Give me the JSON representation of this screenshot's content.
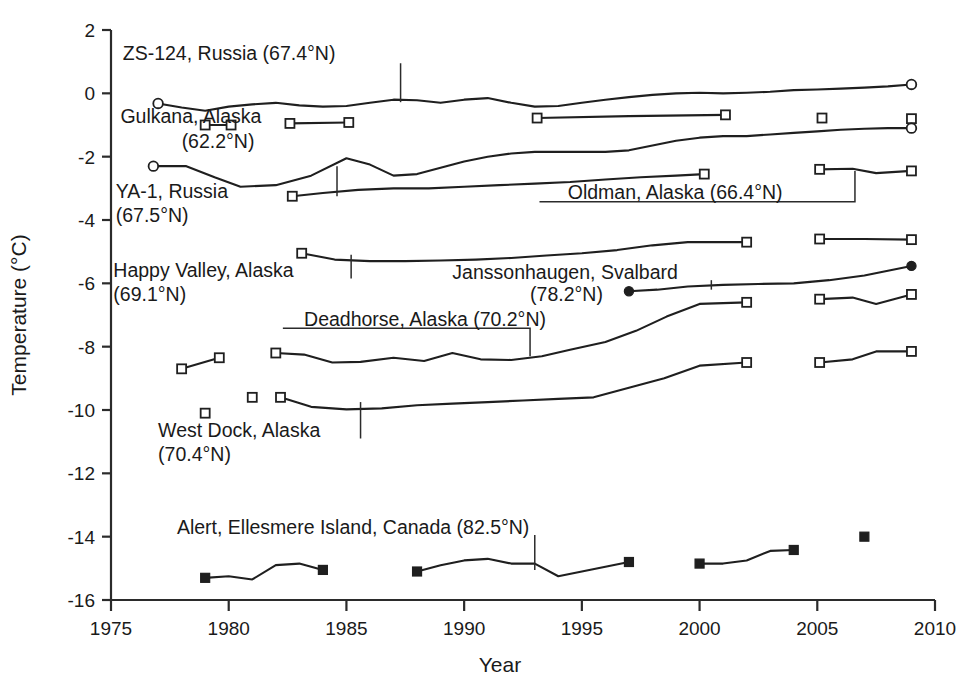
{
  "chart_data": {
    "type": "line",
    "title": "",
    "xlabel": "Year",
    "ylabel": "Temperature (°C)",
    "xlim": [
      1975,
      2010
    ],
    "ylim": [
      -16,
      2
    ],
    "xticks": [
      1975,
      1980,
      1985,
      1990,
      1995,
      2000,
      2005,
      2010
    ],
    "yticks": [
      2,
      0,
      -2,
      -4,
      -6,
      -8,
      -10,
      -12,
      -14,
      -16
    ],
    "grid": false,
    "legend_position": "inline-annotations",
    "series": [
      {
        "name": "ZS-124, Russia (67.4°N)",
        "label": "ZS-124, Russia (67.4°N)",
        "marker": "open-circle",
        "segments": [
          {
            "x": [
              1977,
              1978,
              1979,
              1980,
              1981,
              1982,
              1983,
              1984,
              1985,
              1986,
              1987,
              1988,
              1989,
              1990,
              1991,
              1992,
              1993,
              1994,
              1995,
              1996,
              1997,
              1998,
              1999,
              2000,
              2001,
              2002,
              2003,
              2004,
              2005,
              2006,
              2007,
              2008,
              2009
            ],
            "y": [
              -0.32,
              -0.45,
              -0.55,
              -0.42,
              -0.35,
              -0.3,
              -0.38,
              -0.42,
              -0.4,
              -0.3,
              -0.2,
              -0.22,
              -0.3,
              -0.2,
              -0.15,
              -0.3,
              -0.42,
              -0.4,
              -0.3,
              -0.2,
              -0.12,
              -0.05,
              0.0,
              0.02,
              0.0,
              0.02,
              0.05,
              0.1,
              0.12,
              0.15,
              0.18,
              0.22,
              0.28
            ],
            "start_marker": "open-circle",
            "end_marker": "open-circle"
          }
        ]
      },
      {
        "name": "Gulkana, Alaska (62.2°N)",
        "label": "Gulkana, Alaska (62.2°N)",
        "marker": "open-square",
        "segments": [
          {
            "x": [
              1979,
              1980.1
            ],
            "y": [
              -1.0,
              -1.0
            ],
            "start_marker": "open-square",
            "end_marker": "open-square"
          },
          {
            "x": [
              1982.6,
              1985.1
            ],
            "y": [
              -0.95,
              -0.92
            ],
            "start_marker": "open-square",
            "end_marker": "open-square"
          },
          {
            "x": [
              1993.1,
              1997.0,
              2001.1
            ],
            "y": [
              -0.78,
              -0.72,
              -0.68
            ],
            "start_marker": "open-square",
            "end_marker": "open-square"
          },
          {
            "x": [
              2005.2
            ],
            "y": [
              -0.78
            ],
            "start_marker": "open-square",
            "end_marker": "open-square"
          },
          {
            "x": [
              2009.0
            ],
            "y": [
              -0.8
            ],
            "start_marker": "open-square",
            "end_marker": "open-square"
          }
        ]
      },
      {
        "name": "YA-1, Russia (67.5°N)",
        "label": "YA-1, Russia (67.5°N)",
        "marker": "open-circle",
        "segments": [
          {
            "x": [
              1976.8,
              1978.2,
              1979.4,
              1980.5,
              1982,
              1983.5,
              1985,
              1986,
              1987,
              1988,
              1989,
              1990,
              1991,
              1992,
              1993,
              1994,
              1995,
              1996,
              1997,
              1998,
              1999,
              2000,
              2001,
              2002,
              2003,
              2004,
              2005,
              2006,
              2007,
              2008,
              2009
            ],
            "y": [
              -2.3,
              -2.3,
              -2.65,
              -2.95,
              -2.9,
              -2.6,
              -2.05,
              -2.25,
              -2.6,
              -2.55,
              -2.35,
              -2.15,
              -2.0,
              -1.9,
              -1.85,
              -1.85,
              -1.85,
              -1.85,
              -1.8,
              -1.65,
              -1.5,
              -1.4,
              -1.35,
              -1.35,
              -1.3,
              -1.25,
              -1.2,
              -1.15,
              -1.12,
              -1.1,
              -1.1
            ],
            "start_marker": "open-circle",
            "end_marker": "open-circle"
          }
        ]
      },
      {
        "name": "Oldman, Alaska (66.4°N)",
        "label": "Oldman, Alaska (66.4°N)",
        "marker": "open-square",
        "segments": [
          {
            "x": [
              1982.7,
              1984,
              1985.5,
              1987,
              1988.5,
              1990,
              1991.5,
              1993,
              1994.5,
              1996,
              1997.5,
              1999,
              2000.2
            ],
            "y": [
              -3.25,
              -3.15,
              -3.05,
              -3.0,
              -3.0,
              -2.95,
              -2.9,
              -2.85,
              -2.8,
              -2.72,
              -2.65,
              -2.6,
              -2.55
            ],
            "start_marker": "open-square",
            "end_marker": "open-square"
          },
          {
            "x": [
              2005.1,
              2006.5,
              2007.5,
              2009
            ],
            "y": [
              -2.4,
              -2.38,
              -2.52,
              -2.45
            ],
            "start_marker": "open-square",
            "end_marker": "open-square"
          }
        ]
      },
      {
        "name": "Happy Valley, Alaska (69.1°N)",
        "label": "Happy Valley, Alaska (69.1°N)",
        "marker": "open-square",
        "segments": [
          {
            "x": [
              1983.1,
              1984.5,
              1986,
              1987.5,
              1989,
              1990.5,
              1992,
              1993.5,
              1995,
              1996.5,
              1998,
              1999.5,
              2002
            ],
            "y": [
              -5.05,
              -5.25,
              -5.3,
              -5.3,
              -5.28,
              -5.25,
              -5.2,
              -5.12,
              -5.05,
              -4.95,
              -4.8,
              -4.7,
              -4.7
            ],
            "start_marker": "open-square",
            "end_marker": "open-square"
          },
          {
            "x": [
              2005.1,
              2007,
              2009
            ],
            "y": [
              -4.6,
              -4.6,
              -4.62
            ],
            "start_marker": "open-square",
            "end_marker": "open-square"
          }
        ]
      },
      {
        "name": "Janssonhaugen, Svalbard (78.2°N)",
        "label": "Janssonhaugen, Svalbard (78.2°N)",
        "marker": "filled-circle",
        "segments": [
          {
            "x": [
              1997.0,
              1998.2,
              1999.5,
              2001,
              2002.5,
              2004,
              2005.5,
              2007,
              2008,
              2009
            ],
            "y": [
              -6.25,
              -6.2,
              -6.1,
              -6.05,
              -6.02,
              -6.0,
              -5.9,
              -5.75,
              -5.6,
              -5.45
            ],
            "start_marker": "filled-circle",
            "end_marker": "filled-circle"
          }
        ]
      },
      {
        "name": "Deadhorse, Alaska (70.2°N)",
        "label": "Deadhorse, Alaska (70.2°N)",
        "marker": "open-square",
        "segments": [
          {
            "x": [
              1978,
              1979.6
            ],
            "y": [
              -8.7,
              -8.35
            ],
            "start_marker": "open-square",
            "end_marker": "open-square"
          },
          {
            "x": [
              1982,
              1983.2,
              1984.4,
              1985.6,
              1987,
              1988.3,
              1989.5,
              1990.7,
              1992,
              1993.3,
              1994.5,
              1996,
              1997.3,
              1998.6,
              2000,
              2002
            ],
            "y": [
              -8.2,
              -8.25,
              -8.5,
              -8.48,
              -8.35,
              -8.45,
              -8.2,
              -8.4,
              -8.42,
              -8.3,
              -8.1,
              -7.85,
              -7.5,
              -7.05,
              -6.65,
              -6.6
            ],
            "start_marker": "open-square",
            "end_marker": "open-square"
          },
          {
            "x": [
              2005.1,
              2006.5,
              2007.5,
              2009
            ],
            "y": [
              -6.5,
              -6.45,
              -6.65,
              -6.35
            ],
            "start_marker": "open-square",
            "end_marker": "open-square"
          }
        ]
      },
      {
        "name": "West Dock, Alaska (70.4°N)",
        "label": "West Dock, Alaska (70.4°N)",
        "marker": "open-square",
        "segments": [
          {
            "x": [
              1979.0
            ],
            "y": [
              -10.1
            ],
            "start_marker": "open-square",
            "end_marker": "open-square"
          },
          {
            "x": [
              1981.0
            ],
            "y": [
              -9.6
            ],
            "start_marker": "open-square",
            "end_marker": "open-square"
          },
          {
            "x": [
              1982.2,
              1983.5,
              1985,
              1986.5,
              1988,
              1989.5,
              1991,
              1992.5,
              1994,
              1995.5,
              1997,
              1998.5,
              2000,
              2002
            ],
            "y": [
              -9.6,
              -9.9,
              -9.98,
              -9.95,
              -9.85,
              -9.8,
              -9.75,
              -9.7,
              -9.65,
              -9.6,
              -9.3,
              -9.0,
              -8.6,
              -8.5
            ],
            "start_marker": "open-square",
            "end_marker": "open-square"
          },
          {
            "x": [
              2005.1,
              2006.5,
              2007.5,
              2009
            ],
            "y": [
              -8.5,
              -8.4,
              -8.15,
              -8.15
            ],
            "start_marker": "open-square",
            "end_marker": "open-square"
          }
        ]
      },
      {
        "name": "Alert, Ellesmere Island, Canada (82.5°N)",
        "label": "Alert, Ellesmere Island, Canada (82.5°N)",
        "marker": "filled-square",
        "segments": [
          {
            "x": [
              1979,
              1980,
              1981,
              1982,
              1983,
              1984
            ],
            "y": [
              -15.3,
              -15.25,
              -15.35,
              -14.9,
              -14.85,
              -15.05
            ],
            "start_marker": "filled-square",
            "end_marker": "filled-square"
          },
          {
            "x": [
              1988,
              1989,
              1990,
              1991,
              1992,
              1993,
              1994,
              1995,
              1996,
              1997
            ],
            "y": [
              -15.1,
              -14.9,
              -14.75,
              -14.7,
              -14.85,
              -14.85,
              -15.25,
              -15.1,
              -14.95,
              -14.8
            ],
            "start_marker": "filled-square",
            "end_marker": "filled-square"
          },
          {
            "x": [
              2000,
              2001,
              2002,
              2003,
              2004
            ],
            "y": [
              -14.85,
              -14.85,
              -14.75,
              -14.45,
              -14.42
            ],
            "start_marker": "filled-square",
            "end_marker": "filled-square"
          },
          {
            "x": [
              2007
            ],
            "y": [
              -14.0
            ],
            "start_marker": "filled-square",
            "end_marker": "filled-square"
          }
        ]
      }
    ],
    "annotations": [
      {
        "id": "zs124",
        "text": "ZS-124, Russia (67.4°N)",
        "x": 1975.5,
        "y": 1.05,
        "anchor": "start",
        "leader": [
          [
            1987.3,
            0.95
          ],
          [
            1987.3,
            -0.28
          ]
        ]
      },
      {
        "id": "gulkana-1",
        "text": "Gulkana, Alaska",
        "x": 1975.4,
        "y": -0.95,
        "anchor": "start",
        "leader": []
      },
      {
        "id": "gulkana-2",
        "text": "(62.2°N)",
        "x": 1978.0,
        "y": -1.72,
        "anchor": "start",
        "leader": []
      },
      {
        "id": "ya1-1",
        "text": "YA-1, Russia",
        "x": 1975.2,
        "y": -3.3,
        "anchor": "start",
        "leader": [
          [
            1984.6,
            -3.25
          ],
          [
            1984.6,
            -2.3
          ]
        ]
      },
      {
        "id": "ya1-2",
        "text": "(67.5°N)",
        "x": 1975.2,
        "y": -4.05,
        "anchor": "start",
        "leader": []
      },
      {
        "id": "oldman",
        "text": "Oldman, Alaska (66.4°N)",
        "x": 1994.4,
        "y": -3.35,
        "anchor": "start",
        "leader": [
          [
            1993.2,
            -3.42
          ],
          [
            2006.6,
            -3.42
          ],
          [
            2006.6,
            -2.45
          ]
        ]
      },
      {
        "id": "happy-1",
        "text": "Happy Valley, Alaska",
        "x": 1975.1,
        "y": -5.8,
        "anchor": "start",
        "leader": [
          [
            1985.2,
            -5.85
          ],
          [
            1985.2,
            -5.1
          ]
        ]
      },
      {
        "id": "happy-2",
        "text": "(69.1°N)",
        "x": 1975.1,
        "y": -6.55,
        "anchor": "start",
        "leader": []
      },
      {
        "id": "jansson-1",
        "text": "Janssonhaugen, Svalbard",
        "x": 1989.5,
        "y": -5.85,
        "anchor": "start",
        "leader": [
          [
            2000.5,
            -5.9
          ],
          [
            2000.5,
            -6.2
          ]
        ]
      },
      {
        "id": "jansson-2",
        "text": "(78.2°N)",
        "x": 1992.8,
        "y": -6.55,
        "anchor": "start",
        "leader": []
      },
      {
        "id": "deadhorse",
        "text": "Deadhorse, Alaska (70.2°N)",
        "x": 1983.2,
        "y": -7.35,
        "anchor": "start",
        "leader": [
          [
            1982.3,
            -7.42
          ],
          [
            1992.8,
            -7.42
          ],
          [
            1992.8,
            -8.3
          ]
        ]
      },
      {
        "id": "westdock-1",
        "text": "West Dock, Alaska",
        "x": 1977.0,
        "y": -10.85,
        "anchor": "start",
        "leader": [
          [
            1985.6,
            -10.9
          ],
          [
            1985.6,
            -9.75
          ]
        ]
      },
      {
        "id": "westdock-2",
        "text": "(70.4°N)",
        "x": 1977.0,
        "y": -11.6,
        "anchor": "start",
        "leader": []
      },
      {
        "id": "alert",
        "text": "Alert, Ellesmere Island, Canada (82.5°N)",
        "x": 1977.8,
        "y": -13.9,
        "anchor": "start",
        "leader": [
          [
            1993.0,
            -13.95
          ],
          [
            1993.0,
            -15.05
          ]
        ]
      }
    ]
  },
  "colors": {
    "line": "#1f1f1f",
    "axis": "#2b2b2b",
    "background": "#ffffff",
    "marker_fill": "#ffffff"
  }
}
